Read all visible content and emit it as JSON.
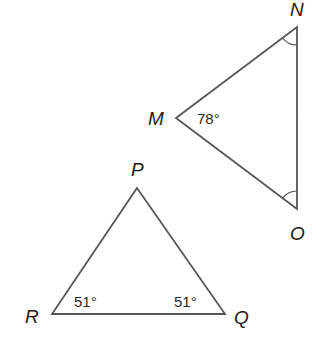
{
  "diagram": {
    "colors": {
      "stroke": "#555555",
      "text": "#1a1a1a",
      "background": "#fefefe"
    },
    "triangles": [
      {
        "name": "MNO",
        "vertices": {
          "M": {
            "label": "M",
            "angle": "78°"
          },
          "N": {
            "label": "N",
            "angle_mark": "arc"
          },
          "O": {
            "label": "O",
            "angle_mark": "arc"
          }
        }
      },
      {
        "name": "PQR",
        "vertices": {
          "P": {
            "label": "P"
          },
          "Q": {
            "label": "Q",
            "angle": "51°"
          },
          "R": {
            "label": "R",
            "angle": "51°"
          }
        }
      }
    ]
  }
}
